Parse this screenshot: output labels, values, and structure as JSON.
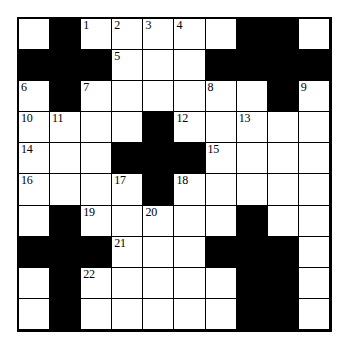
{
  "puzzle": {
    "type": "crossword-grid",
    "rows": 10,
    "columns": 10,
    "colors": {
      "block": "#000000",
      "open": "#ffffff",
      "grid_line": "#000000",
      "number": "#000000",
      "page_background": "#ffffff"
    },
    "numbers_visible": [
      1,
      2,
      3,
      4,
      5,
      6,
      7,
      8,
      9,
      10,
      11,
      12,
      13,
      14,
      15,
      16,
      17,
      18,
      19,
      20,
      21,
      22
    ],
    "grid": [
      [
        {
          "state": "open",
          "number": ""
        },
        {
          "state": "block",
          "number": ""
        },
        {
          "state": "open",
          "number": "1"
        },
        {
          "state": "open",
          "number": "2"
        },
        {
          "state": "open",
          "number": "3"
        },
        {
          "state": "open",
          "number": "4"
        },
        {
          "state": "open",
          "number": ""
        },
        {
          "state": "block",
          "number": ""
        },
        {
          "state": "block",
          "number": ""
        },
        {
          "state": "open",
          "number": ""
        }
      ],
      [
        {
          "state": "block",
          "number": ""
        },
        {
          "state": "block",
          "number": ""
        },
        {
          "state": "block",
          "number": ""
        },
        {
          "state": "open",
          "number": "5"
        },
        {
          "state": "open",
          "number": ""
        },
        {
          "state": "open",
          "number": ""
        },
        {
          "state": "block",
          "number": ""
        },
        {
          "state": "block",
          "number": ""
        },
        {
          "state": "block",
          "number": ""
        },
        {
          "state": "block",
          "number": ""
        }
      ],
      [
        {
          "state": "open",
          "number": "6"
        },
        {
          "state": "block",
          "number": ""
        },
        {
          "state": "open",
          "number": "7"
        },
        {
          "state": "open",
          "number": ""
        },
        {
          "state": "open",
          "number": ""
        },
        {
          "state": "open",
          "number": ""
        },
        {
          "state": "open",
          "number": "8"
        },
        {
          "state": "open",
          "number": ""
        },
        {
          "state": "block",
          "number": ""
        },
        {
          "state": "open",
          "number": "9"
        }
      ],
      [
        {
          "state": "open",
          "number": "10"
        },
        {
          "state": "open",
          "number": "11"
        },
        {
          "state": "open",
          "number": ""
        },
        {
          "state": "open",
          "number": ""
        },
        {
          "state": "block",
          "number": ""
        },
        {
          "state": "open",
          "number": "12"
        },
        {
          "state": "open",
          "number": ""
        },
        {
          "state": "open",
          "number": "13"
        },
        {
          "state": "open",
          "number": ""
        },
        {
          "state": "open",
          "number": ""
        }
      ],
      [
        {
          "state": "open",
          "number": "14"
        },
        {
          "state": "open",
          "number": ""
        },
        {
          "state": "open",
          "number": ""
        },
        {
          "state": "block",
          "number": ""
        },
        {
          "state": "block",
          "number": ""
        },
        {
          "state": "block",
          "number": ""
        },
        {
          "state": "open",
          "number": "15"
        },
        {
          "state": "open",
          "number": ""
        },
        {
          "state": "open",
          "number": ""
        },
        {
          "state": "open",
          "number": ""
        }
      ],
      [
        {
          "state": "open",
          "number": "16"
        },
        {
          "state": "open",
          "number": ""
        },
        {
          "state": "open",
          "number": ""
        },
        {
          "state": "open",
          "number": "17"
        },
        {
          "state": "block",
          "number": ""
        },
        {
          "state": "open",
          "number": "18"
        },
        {
          "state": "open",
          "number": ""
        },
        {
          "state": "open",
          "number": ""
        },
        {
          "state": "open",
          "number": ""
        },
        {
          "state": "open",
          "number": ""
        }
      ],
      [
        {
          "state": "open",
          "number": ""
        },
        {
          "state": "block",
          "number": ""
        },
        {
          "state": "open",
          "number": "19"
        },
        {
          "state": "open",
          "number": ""
        },
        {
          "state": "open",
          "number": "20"
        },
        {
          "state": "open",
          "number": ""
        },
        {
          "state": "open",
          "number": ""
        },
        {
          "state": "block",
          "number": ""
        },
        {
          "state": "open",
          "number": ""
        },
        {
          "state": "open",
          "number": ""
        }
      ],
      [
        {
          "state": "block",
          "number": ""
        },
        {
          "state": "block",
          "number": ""
        },
        {
          "state": "block",
          "number": ""
        },
        {
          "state": "open",
          "number": "21"
        },
        {
          "state": "open",
          "number": ""
        },
        {
          "state": "open",
          "number": ""
        },
        {
          "state": "block",
          "number": ""
        },
        {
          "state": "block",
          "number": ""
        },
        {
          "state": "block",
          "number": ""
        },
        {
          "state": "open",
          "number": ""
        }
      ],
      [
        {
          "state": "open",
          "number": ""
        },
        {
          "state": "block",
          "number": ""
        },
        {
          "state": "open",
          "number": "22"
        },
        {
          "state": "open",
          "number": ""
        },
        {
          "state": "open",
          "number": ""
        },
        {
          "state": "open",
          "number": ""
        },
        {
          "state": "open",
          "number": ""
        },
        {
          "state": "block",
          "number": ""
        },
        {
          "state": "block",
          "number": ""
        },
        {
          "state": "open",
          "number": ""
        }
      ],
      [
        {
          "state": "open",
          "number": ""
        },
        {
          "state": "block",
          "number": ""
        },
        {
          "state": "open",
          "number": ""
        },
        {
          "state": "open",
          "number": ""
        },
        {
          "state": "open",
          "number": ""
        },
        {
          "state": "open",
          "number": ""
        },
        {
          "state": "open",
          "number": ""
        },
        {
          "state": "block",
          "number": ""
        },
        {
          "state": "block",
          "number": ""
        },
        {
          "state": "open",
          "number": ""
        }
      ]
    ]
  }
}
